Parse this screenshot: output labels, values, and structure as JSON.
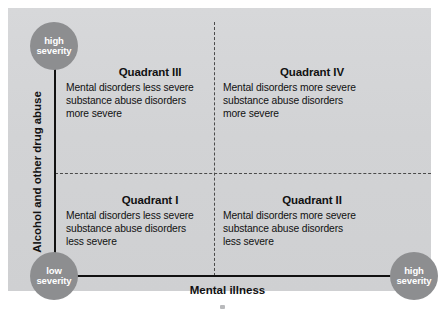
{
  "diagram": {
    "type": "quadrant-matrix",
    "y_axis": {
      "title": "Alcohol and other drug abuse",
      "low_label_line1": "low",
      "low_label_line2": "severity",
      "high_label_line1": "high",
      "high_label_line2": "severity"
    },
    "x_axis": {
      "title": "Mental illness",
      "high_label_line1": "high",
      "high_label_line2": "severity"
    },
    "quadrants": [
      {
        "id": "quadrant-3",
        "title": "Quadrant III",
        "body_line1": "Mental disorders less severe",
        "body_line2": "substance abuse disorders",
        "body_line3": "more severe"
      },
      {
        "id": "quadrant-4",
        "title": "Quadrant IV",
        "body_line1": "Mental disorders more severe",
        "body_line2": "substance abuse disorders",
        "body_line3": "more severe"
      },
      {
        "id": "quadrant-1",
        "title": "Quadrant I",
        "body_line1": "Mental disorders less severe",
        "body_line2": "substance abuse disorders",
        "body_line3": "less severe"
      },
      {
        "id": "quadrant-2",
        "title": "Quadrant II",
        "body_line1": "Mental disorders more severe",
        "body_line2": "substance abuse disorders",
        "body_line3": "less severe"
      }
    ],
    "colors": {
      "panel_background": "#d4d5d7",
      "circle_fill": "#8d8e90",
      "circle_text": "#ffffff",
      "axis_line": "#111111",
      "divider_line": "#4a4a4a",
      "text": "#111111"
    }
  }
}
